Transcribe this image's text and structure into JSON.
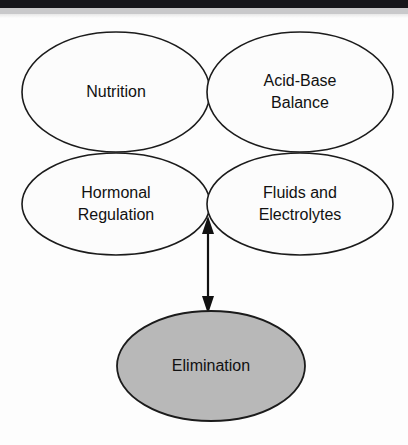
{
  "figure": {
    "background_color": "#fdfdfd",
    "scan_artifacts": {
      "top_dark_bar_color": "#16161a",
      "top_gray_bar_color": "#c9c9cb"
    },
    "nodes": [
      {
        "id": "nutrition",
        "label": "Nutrition",
        "lines": [
          "Nutrition"
        ],
        "fill": "#fcfcfc",
        "stroke": "#1b1b1b",
        "shape": "ellipse",
        "position": "top-left"
      },
      {
        "id": "acid-base-balance",
        "label": "Acid-Base Balance",
        "lines": [
          "Acid-Base",
          "Balance"
        ],
        "fill": "#fcfcfc",
        "stroke": "#1b1b1b",
        "shape": "ellipse",
        "position": "top-right"
      },
      {
        "id": "hormonal-regulation",
        "label": "Hormonal Regulation",
        "lines": [
          "Hormonal",
          "Regulation"
        ],
        "fill": "#fcfcfc",
        "stroke": "#1b1b1b",
        "shape": "ellipse",
        "position": "middle-left"
      },
      {
        "id": "fluids-and-electrolytes",
        "label": "Fluids and Electrolytes",
        "lines": [
          "Fluids and",
          "Electrolytes"
        ],
        "fill": "#fcfcfc",
        "stroke": "#1b1b1b",
        "shape": "ellipse",
        "position": "middle-right"
      },
      {
        "id": "elimination",
        "label": "Elimination",
        "lines": [
          "Elimination"
        ],
        "fill": "#b8b8b8",
        "stroke": "#1b1b1b",
        "shape": "ellipse",
        "position": "bottom-center"
      }
    ],
    "connectors": [
      {
        "id": "cluster-to-elimination",
        "from": "concept-cluster",
        "to": "elimination",
        "style": "double-headed-arrow",
        "orientation": "vertical",
        "color": "#111111"
      }
    ]
  }
}
